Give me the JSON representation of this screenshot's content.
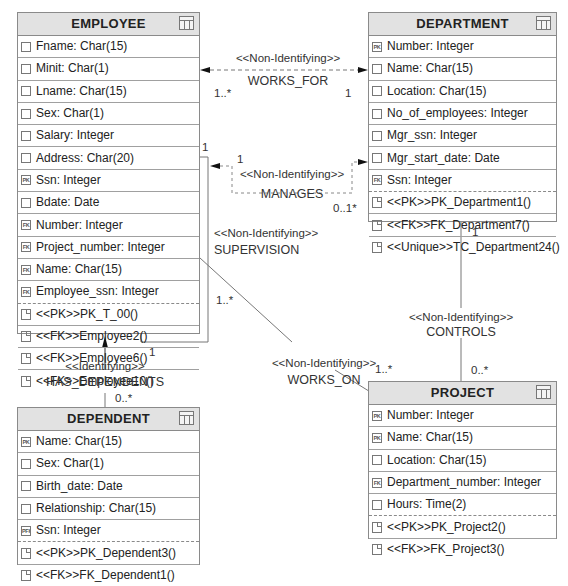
{
  "entities": {
    "employee": {
      "title": "EMPLOYEE",
      "attributes": [
        {
          "key": "",
          "text": "Fname: Char(15)"
        },
        {
          "key": "",
          "text": "Minit: Char(1)"
        },
        {
          "key": "",
          "text": "Lname: Char(15)"
        },
        {
          "key": "",
          "text": "Sex: Char(1)"
        },
        {
          "key": "",
          "text": "Salary: Integer"
        },
        {
          "key": "",
          "text": "Address: Char(20)"
        },
        {
          "key": "PK",
          "text": "Ssn: Integer"
        },
        {
          "key": "",
          "text": "Bdate: Date"
        },
        {
          "key": "FK",
          "text": "Number: Integer"
        },
        {
          "key": "FK",
          "text": "Project_number: Integer"
        },
        {
          "key": "FK",
          "text": "Name: Char(15)"
        },
        {
          "key": "FK",
          "text": "Employee_ssn: Integer"
        }
      ],
      "operations": [
        "<<PK>>PK_T_00()",
        "<<FK>>Employee2()",
        "<<FK>>Employee6()",
        "<<FK>>Employee10()"
      ]
    },
    "department": {
      "title": "DEPARTMENT",
      "attributes": [
        {
          "key": "PK",
          "text": "Number: Integer"
        },
        {
          "key": "",
          "text": "Name: Char(15)"
        },
        {
          "key": "",
          "text": "Location: Char(15)"
        },
        {
          "key": "",
          "text": "No_of_employees: Integer"
        },
        {
          "key": "",
          "text": "Mgr_ssn: Integer"
        },
        {
          "key": "",
          "text": "Mgr_start_date: Date"
        },
        {
          "key": "FK",
          "text": "Ssn: Integer"
        }
      ],
      "operations": [
        "<<PK>>PK_Department1()",
        "<<FK>>FK_Department7()",
        "<<Unique>>TC_Department24()"
      ]
    },
    "dependent": {
      "title": "DEPENDENT",
      "attributes": [
        {
          "key": "PK",
          "text": "Name: Char(15)"
        },
        {
          "key": "",
          "text": "Sex: Char(1)"
        },
        {
          "key": "",
          "text": "Birth_date: Date"
        },
        {
          "key": "",
          "text": "Relationship: Char(15)"
        },
        {
          "key": "PFK",
          "text": "Ssn: Integer"
        }
      ],
      "operations": [
        "<<PK>>PK_Dependent3()",
        "<<FK>>FK_Dependent1()"
      ]
    },
    "project": {
      "title": "PROJECT",
      "attributes": [
        {
          "key": "PK",
          "text": "Number: Integer"
        },
        {
          "key": "PK",
          "text": "Name: Char(15)"
        },
        {
          "key": "",
          "text": "Location: Char(15)"
        },
        {
          "key": "FK",
          "text": "Department_number: Integer"
        },
        {
          "key": "",
          "text": "Hours: Time(2)"
        }
      ],
      "operations": [
        "<<PK>>PK_Project2()",
        "<<FK>>FK_Project3()"
      ]
    }
  },
  "relationships": {
    "works_for": {
      "stereotype": "<<Non-Identifying>>",
      "name": "WORKS_FOR",
      "mult_left": "1..*",
      "mult_right": "1"
    },
    "manages": {
      "stereotype": "<<Non-Identifying>>",
      "name": "MANAGES",
      "mult_left": "1",
      "mult_right": "0..1*"
    },
    "supervision": {
      "stereotype": "<<Non-Identifying>>",
      "name": "SUPERVISION",
      "mult_top": "1",
      "mult_bottom": "1"
    },
    "works_on": {
      "stereotype": "<<Non-Identifying>>",
      "name": "WORKS_ON",
      "mult_employee": "1..*",
      "mult_project": "1..*"
    },
    "controls": {
      "stereotype": "<<Non-Identifying>>",
      "name": "CONTROLS",
      "mult_top": "1",
      "mult_bottom": "0..*"
    },
    "has_dependents": {
      "stereotype": "<<Identifying>>",
      "name": "HAS_DEPENDENTS",
      "mult_bottom": "0..*"
    }
  }
}
